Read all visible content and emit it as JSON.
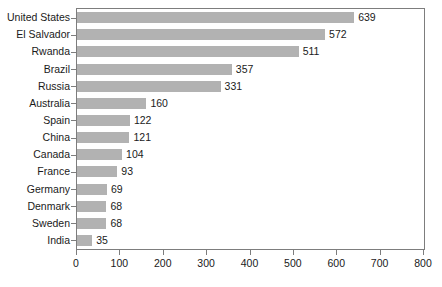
{
  "chart_data": {
    "type": "bar",
    "orientation": "horizontal",
    "title": "",
    "subtitle": "",
    "xlabel": "",
    "ylabel": "",
    "xlim": [
      0,
      800
    ],
    "xticks": [
      0,
      100,
      200,
      300,
      400,
      500,
      600,
      700,
      800
    ],
    "grid": false,
    "legend": null,
    "show_value_labels": true,
    "categories": [
      "United States",
      "El Salvador",
      "Rwanda",
      "Brazil",
      "Russia",
      "Australia",
      "Spain",
      "China",
      "Canada",
      "France",
      "Germany",
      "Denmark",
      "Sweden",
      "India"
    ],
    "values": [
      639,
      572,
      511,
      357,
      331,
      160,
      122,
      121,
      104,
      93,
      69,
      68,
      68,
      35
    ],
    "value_labels": [
      "639",
      "572",
      "511",
      "357",
      "331",
      "160",
      "122",
      "121",
      "104",
      "93",
      "69",
      "68",
      "68",
      "35"
    ],
    "tick_labels": [
      "0",
      "100",
      "200",
      "300",
      "400",
      "500",
      "600",
      "700",
      "800"
    ],
    "colors": {
      "bar_fill": "#b2b2b2",
      "axis_line": "#7d7d7d",
      "text": "#1a1a1a",
      "background": "#ffffff"
    }
  }
}
